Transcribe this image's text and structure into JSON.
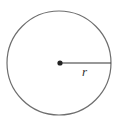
{
  "diagram": {
    "type": "circle-radius",
    "circle": {
      "cx": 59,
      "cy": 63,
      "r": 52,
      "stroke": "#6e6e6e"
    },
    "center_dot": {
      "cx": 60,
      "cy": 63,
      "r": 2.6,
      "fill": "#222222"
    },
    "radius_line": {
      "x1": 60,
      "y1": 63,
      "x2": 111,
      "y2": 63,
      "stroke": "#333333"
    },
    "radius_label": "r"
  }
}
